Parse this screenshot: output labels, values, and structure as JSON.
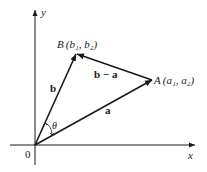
{
  "diagram": {
    "type": "vector-diagram",
    "axes": {
      "x_label": "x",
      "y_label": "y",
      "origin_label": "0"
    },
    "points": [
      {
        "name": "B",
        "label": "B",
        "coords": "(b₁, b₂)"
      },
      {
        "name": "A",
        "label": "A",
        "coords": "(a₁, a₂)"
      }
    ],
    "vectors": [
      {
        "name": "b",
        "label": "b",
        "from": "0",
        "to": "B"
      },
      {
        "name": "a",
        "label": "a",
        "from": "0",
        "to": "A"
      },
      {
        "name": "b-a",
        "label": "b − a",
        "from": "A",
        "to": "B"
      }
    ],
    "angle": {
      "label": "θ",
      "between": [
        "a",
        "b"
      ]
    },
    "colors": {
      "stroke": "#1a1a1a",
      "background": "#ffffff"
    }
  }
}
